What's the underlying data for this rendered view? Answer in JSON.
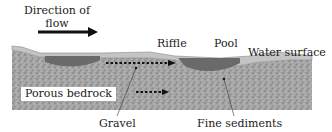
{
  "title": {
    "line1": "Direction of",
    "line2": "flow"
  },
  "labels": {
    "riffle": "Riffle",
    "pool": "Pool",
    "water_surface": "Water surface",
    "porous_bedrock": "Porous bedrock",
    "gravel": "Gravel",
    "fine_sediments": "Fine sediments"
  },
  "colors": {
    "water": "#bdbdbd",
    "pool_water": "#6e6e6e",
    "gravel": "#9a9a9a",
    "text": "#1a1a1a",
    "arrow": "#111111"
  },
  "icons": {
    "flow_arrow": "right-arrow",
    "subsurface_flow_arrow": "dotted-right-arrow"
  }
}
